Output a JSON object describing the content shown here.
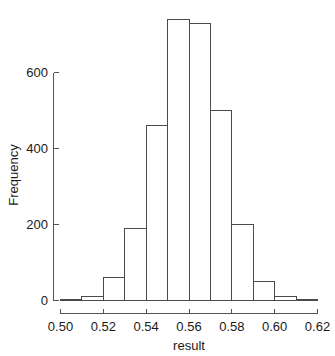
{
  "chart_data": {
    "type": "bar",
    "subtype": "histogram",
    "title": "",
    "xlabel": "result",
    "ylabel": "Frequency",
    "xlim": [
      0.5,
      0.62
    ],
    "ylim": [
      0,
      740
    ],
    "grid": false,
    "legend": null,
    "bin_width": 0.01,
    "bin_edges": [
      0.5,
      0.51,
      0.52,
      0.53,
      0.54,
      0.55,
      0.56,
      0.57,
      0.58,
      0.59,
      0.6,
      0.61,
      0.62
    ],
    "categories": [
      "0.50-0.51",
      "0.51-0.52",
      "0.52-0.53",
      "0.53-0.54",
      "0.54-0.55",
      "0.55-0.56",
      "0.56-0.57",
      "0.57-0.58",
      "0.58-0.59",
      "0.59-0.60",
      "0.60-0.61",
      "0.61-0.62"
    ],
    "values": [
      2,
      10,
      60,
      190,
      460,
      740,
      730,
      500,
      200,
      50,
      10,
      2
    ],
    "xticks": [
      0.5,
      0.52,
      0.54,
      0.56,
      0.58,
      0.6,
      0.62
    ],
    "xtick_labels": [
      "0.50",
      "0.52",
      "0.54",
      "0.56",
      "0.58",
      "0.60",
      "0.62"
    ],
    "yticks": [
      0,
      200,
      400,
      600
    ],
    "ytick_labels": [
      "0",
      "200",
      "400",
      "600"
    ],
    "colors": {
      "bar_fill": "#ffffff",
      "bar_stroke": "#4a4a4a",
      "axis": "#555555",
      "text": "#1a1a1a",
      "background": "#ffffff"
    }
  }
}
